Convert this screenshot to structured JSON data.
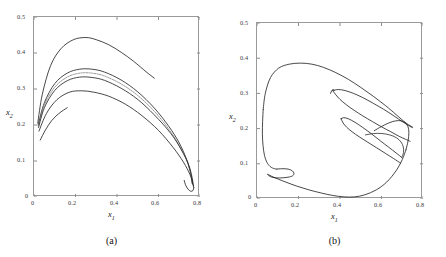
{
  "figure": {
    "faint_header_text": "",
    "panels": [
      {
        "id": "a",
        "caption": "(a)",
        "xlabel": "x",
        "xlabel_sub": "1",
        "ylabel": "x",
        "ylabel_sub": "2",
        "xticks": [
          "0",
          "0.2",
          "0.4",
          "0.6",
          "0.8"
        ],
        "yticks": [
          "0",
          "0.1",
          "0.2",
          "0.3",
          "0.4",
          "0.5"
        ]
      },
      {
        "id": "b",
        "caption": "(b)",
        "xlabel": "x",
        "xlabel_sub": "1",
        "ylabel": "x",
        "ylabel_sub": "2",
        "xticks": [
          "0",
          "0.2",
          "0.4",
          "0.6",
          "0.8"
        ],
        "yticks": [
          "0",
          "0.1",
          "0.2",
          "0.3",
          "0.4",
          "0.5"
        ]
      }
    ]
  },
  "chart_data": [
    {
      "type": "line",
      "title": "",
      "subplot_label": "(a)",
      "xlabel": "x1",
      "ylabel": "x2",
      "xlim": [
        0,
        0.8
      ],
      "ylim": [
        0,
        0.5
      ],
      "xticks": [
        0,
        0.2,
        0.4,
        0.6,
        0.8
      ],
      "yticks": [
        0,
        0.1,
        0.2,
        0.3,
        0.4,
        0.5
      ],
      "grid": false,
      "legend": "none",
      "description": "Phase-plane trajectories (transient / quasi-periodic bundle) converging from near (0.02, 0.20) arcing over to a cusp near (0.75, 0.03)",
      "series": [
        {
          "name": "outer-upper-arc",
          "color": "#1a1a1a",
          "x": [
            0.018,
            0.04,
            0.08,
            0.13,
            0.19,
            0.25,
            0.3,
            0.36,
            0.42,
            0.48,
            0.54,
            0.58
          ],
          "y": [
            0.205,
            0.285,
            0.365,
            0.412,
            0.437,
            0.443,
            0.437,
            0.423,
            0.402,
            0.377,
            0.348,
            0.33
          ]
        },
        {
          "name": "band-upper-edge",
          "color": "#1a1a1a",
          "x": [
            0.02,
            0.05,
            0.1,
            0.16,
            0.22,
            0.28,
            0.34,
            0.42,
            0.5,
            0.58,
            0.65,
            0.7,
            0.735,
            0.755,
            0.762
          ],
          "y": [
            0.2,
            0.262,
            0.315,
            0.344,
            0.355,
            0.355,
            0.347,
            0.325,
            0.292,
            0.247,
            0.196,
            0.15,
            0.105,
            0.065,
            0.038
          ]
        },
        {
          "name": "band-dotted-core",
          "color": "#6d6d6d",
          "x": [
            0.021,
            0.05,
            0.1,
            0.16,
            0.22,
            0.28,
            0.34,
            0.42,
            0.5,
            0.58,
            0.65,
            0.7,
            0.738,
            0.757,
            0.764
          ],
          "y": [
            0.197,
            0.255,
            0.305,
            0.333,
            0.344,
            0.344,
            0.336,
            0.314,
            0.282,
            0.238,
            0.188,
            0.143,
            0.1,
            0.06,
            0.034
          ]
        },
        {
          "name": "band-lower-edge",
          "color": "#1a1a1a",
          "x": [
            0.022,
            0.05,
            0.1,
            0.16,
            0.22,
            0.28,
            0.34,
            0.42,
            0.5,
            0.58,
            0.66,
            0.71,
            0.745,
            0.762,
            0.768
          ],
          "y": [
            0.193,
            0.248,
            0.296,
            0.323,
            0.333,
            0.332,
            0.324,
            0.302,
            0.271,
            0.228,
            0.176,
            0.131,
            0.09,
            0.054,
            0.03
          ]
        },
        {
          "name": "inner-lower-arc",
          "color": "#1a1a1a",
          "x": [
            0.024,
            0.06,
            0.11,
            0.17,
            0.23,
            0.29,
            0.36,
            0.44,
            0.52,
            0.6,
            0.67,
            0.72,
            0.752,
            0.766,
            0.77
          ],
          "y": [
            0.183,
            0.232,
            0.27,
            0.291,
            0.295,
            0.291,
            0.28,
            0.258,
            0.226,
            0.185,
            0.138,
            0.097,
            0.062,
            0.036,
            0.026
          ]
        },
        {
          "name": "lowest-stub",
          "color": "#1a1a1a",
          "x": [
            0.03,
            0.055,
            0.085,
            0.12,
            0.16
          ],
          "y": [
            0.158,
            0.186,
            0.212,
            0.232,
            0.248
          ]
        },
        {
          "name": "cusp-return",
          "color": "#1a1a1a",
          "x": [
            0.77,
            0.766,
            0.755,
            0.742,
            0.73,
            0.724
          ],
          "y": [
            0.026,
            0.018,
            0.016,
            0.022,
            0.034,
            0.046
          ]
        }
      ]
    },
    {
      "type": "line",
      "title": "",
      "subplot_label": "(b)",
      "xlabel": "x1",
      "ylabel": "x2",
      "xlim": [
        0,
        0.8
      ],
      "ylim": [
        0,
        0.5
      ],
      "xticks": [
        0,
        0.2,
        0.4,
        0.6,
        0.8
      ],
      "yticks": [
        0,
        0.1,
        0.2,
        0.3,
        0.4,
        0.5
      ],
      "grid": false,
      "legend": "none",
      "description": "Chaotic attractor: large outer loop peaking near (0.27, 0.385), inner folded tongue toward (0.72, 0.21), and a small hook near (0.10, 0.08)",
      "series": [
        {
          "name": "outer-loop",
          "color": "#1a1a1a",
          "x": [
            0.03,
            0.04,
            0.065,
            0.105,
            0.155,
            0.21,
            0.265,
            0.32,
            0.38,
            0.44,
            0.5,
            0.56,
            0.62,
            0.67,
            0.705,
            0.73,
            0.745,
            0.75
          ],
          "y": [
            0.255,
            0.3,
            0.345,
            0.372,
            0.383,
            0.386,
            0.383,
            0.374,
            0.359,
            0.34,
            0.317,
            0.292,
            0.265,
            0.24,
            0.222,
            0.211,
            0.206,
            0.204
          ]
        },
        {
          "name": "outer-loop-descend",
          "color": "#1a1a1a",
          "x": [
            0.03,
            0.027,
            0.026,
            0.029,
            0.036,
            0.048,
            0.062,
            0.075,
            0.085,
            0.092,
            0.096
          ],
          "y": [
            0.255,
            0.22,
            0.185,
            0.152,
            0.124,
            0.104,
            0.093,
            0.088,
            0.086,
            0.085,
            0.085
          ]
        },
        {
          "name": "hook-fold",
          "color": "#1a1a1a",
          "x": [
            0.096,
            0.12,
            0.15,
            0.17,
            0.178,
            0.172,
            0.15,
            0.12,
            0.095,
            0.072,
            0.058,
            0.052
          ],
          "y": [
            0.085,
            0.086,
            0.085,
            0.08,
            0.073,
            0.066,
            0.062,
            0.06,
            0.06,
            0.062,
            0.066,
            0.07
          ]
        },
        {
          "name": "lower-sweep",
          "color": "#1a1a1a",
          "x": [
            0.052,
            0.08,
            0.13,
            0.19,
            0.25,
            0.31,
            0.365,
            0.42,
            0.47,
            0.52,
            0.575,
            0.625,
            0.67,
            0.7,
            0.718
          ],
          "y": [
            0.07,
            0.062,
            0.05,
            0.037,
            0.026,
            0.017,
            0.01,
            0.006,
            0.006,
            0.012,
            0.026,
            0.048,
            0.08,
            0.112,
            0.14
          ]
        },
        {
          "name": "right-turn-up",
          "color": "#1a1a1a",
          "x": [
            0.718,
            0.728,
            0.732,
            0.728,
            0.715,
            0.695,
            0.668,
            0.635,
            0.6,
            0.565
          ],
          "y": [
            0.14,
            0.165,
            0.188,
            0.205,
            0.216,
            0.222,
            0.222,
            0.216,
            0.206,
            0.194
          ]
        },
        {
          "name": "inner-tongue-upper",
          "color": "#1a1a1a",
          "x": [
            0.365,
            0.392,
            0.425,
            0.465,
            0.51,
            0.56,
            0.61,
            0.66,
            0.7,
            0.73,
            0.748
          ],
          "y": [
            0.308,
            0.311,
            0.308,
            0.3,
            0.288,
            0.272,
            0.255,
            0.236,
            0.22,
            0.209,
            0.203
          ]
        },
        {
          "name": "inner-tongue-lower",
          "color": "#1a1a1a",
          "x": [
            0.365,
            0.38,
            0.4,
            0.43,
            0.468,
            0.51,
            0.556,
            0.6,
            0.645,
            0.685,
            0.715,
            0.738
          ],
          "y": [
            0.308,
            0.296,
            0.283,
            0.268,
            0.252,
            0.236,
            0.22,
            0.205,
            0.191,
            0.178,
            0.17,
            0.164
          ]
        },
        {
          "name": "inner-tongue-tip",
          "color": "#1a1a1a",
          "x": [
            0.355,
            0.36,
            0.368,
            0.372
          ],
          "y": [
            0.3,
            0.308,
            0.311,
            0.309
          ]
        },
        {
          "name": "mid-fold-upper",
          "color": "#1a1a1a",
          "x": [
            0.405,
            0.418,
            0.44,
            0.472,
            0.51,
            0.552,
            0.595,
            0.635,
            0.67,
            0.698
          ],
          "y": [
            0.228,
            0.231,
            0.228,
            0.218,
            0.203,
            0.185,
            0.165,
            0.147,
            0.131,
            0.118
          ]
        },
        {
          "name": "mid-fold-lower",
          "color": "#1a1a1a",
          "x": [
            0.405,
            0.415,
            0.432,
            0.458,
            0.492,
            0.532,
            0.575,
            0.618,
            0.658,
            0.692
          ],
          "y": [
            0.228,
            0.216,
            0.204,
            0.191,
            0.177,
            0.162,
            0.146,
            0.13,
            0.115,
            0.102
          ]
        },
        {
          "name": "inner-return-strand",
          "color": "#2b2b2b",
          "x": [
            0.698,
            0.706,
            0.705,
            0.694,
            0.672,
            0.64,
            0.602,
            0.562,
            0.522
          ],
          "y": [
            0.118,
            0.132,
            0.148,
            0.162,
            0.174,
            0.182,
            0.186,
            0.186,
            0.182
          ]
        }
      ]
    }
  ]
}
